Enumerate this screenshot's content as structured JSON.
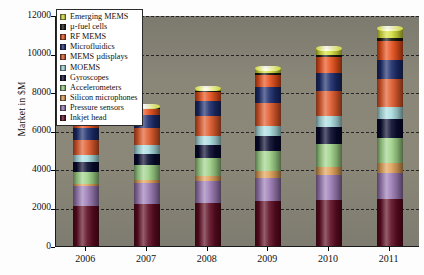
{
  "chart_data": {
    "type": "bar",
    "stacked": true,
    "title": "",
    "xlabel": "",
    "ylabel": "Market in $M",
    "ylim": [
      0,
      12000
    ],
    "ytick_values": [
      0,
      2000,
      4000,
      6000,
      8000,
      10000,
      12000
    ],
    "ytick_labels": [
      "0",
      "2000",
      "4000",
      "6000",
      "8000",
      "10000",
      "12000"
    ],
    "grid": "horizontal-dashed",
    "legend_position": "top-left-inside",
    "categories": [
      "2006",
      "2007",
      "2008",
      "2009",
      "2010",
      "2011"
    ],
    "series": [
      {
        "name": "Inkjet head",
        "color": "#5d0b21",
        "values": [
          2100,
          2180,
          2250,
          2320,
          2380,
          2420
        ]
      },
      {
        "name": "Pressure sensors",
        "color": "#9b7bb5",
        "values": [
          1000,
          1080,
          1150,
          1230,
          1300,
          1380
        ]
      },
      {
        "name": "Silicon microphones",
        "color": "#e0a158",
        "values": [
          110,
          180,
          250,
          330,
          420,
          520
        ]
      },
      {
        "name": "Accelerometers",
        "color": "#9ed288",
        "values": [
          620,
          760,
          900,
          1050,
          1180,
          1300
        ]
      },
      {
        "name": "Gyroscopes",
        "color": "#080a2e",
        "values": [
          520,
          600,
          690,
          790,
          880,
          960
        ]
      },
      {
        "name": "MOEMS",
        "color": "#aadde0",
        "values": [
          400,
          440,
          490,
          540,
          590,
          640
        ]
      },
      {
        "name": "MEMS µdisplays",
        "color": "#e05a2b",
        "values": [
          780,
          900,
          1040,
          1180,
          1320,
          1450
        ]
      },
      {
        "name": "Microfluidics",
        "color": "#1b2b6b",
        "values": [
          600,
          660,
          740,
          820,
          900,
          980
        ]
      },
      {
        "name": "RF MEMS",
        "color": "#e8501c",
        "values": [
          200,
          330,
          480,
          650,
          830,
          1010
        ]
      },
      {
        "name": "µ-fuel cells",
        "color": "#12170f",
        "values": [
          30,
          50,
          70,
          95,
          120,
          150
        ]
      },
      {
        "name": "Emerging MEMS",
        "color": "#d6e03c",
        "values": [
          20,
          60,
          130,
          220,
          340,
          480
        ]
      }
    ],
    "totals": [
      6380,
      7240,
      8190,
      9225,
      10260,
      11290
    ],
    "legend_entries": [
      "Emerging MEMS",
      "µ-fuel cells",
      "RF MEMS",
      "Microfluidics",
      "MEMS µdisplays",
      "MOEMS",
      "Gyroscopes",
      "Accelerometers",
      "Silicon microphones",
      "Pressure sensors",
      "Inkjet head"
    ]
  }
}
